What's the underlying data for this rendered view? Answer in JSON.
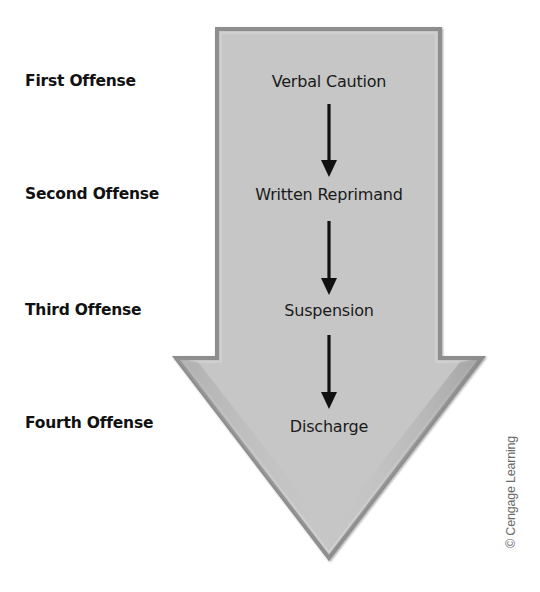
{
  "diagram": {
    "colors": {
      "arrow_fill": "#c6c6c6",
      "arrow_edge": "#8e8e8e",
      "step_arrow": "#111111",
      "text": "#1a1a1a",
      "credit_text": "#6a6a6a"
    },
    "stages": [
      {
        "offense": "First Offense",
        "action": "Verbal Caution"
      },
      {
        "offense": "Second Offense",
        "action": "Written Reprimand"
      },
      {
        "offense": "Third Offense",
        "action": "Suspension"
      },
      {
        "offense": "Fourth Offense",
        "action": "Discharge"
      }
    ],
    "step_arrows": [
      {
        "icon": "arrow-down-icon",
        "from": "Verbal Caution",
        "to": "Written Reprimand"
      },
      {
        "icon": "arrow-down-icon",
        "from": "Written Reprimand",
        "to": "Suspension"
      },
      {
        "icon": "arrow-down-icon",
        "from": "Suspension",
        "to": "Discharge"
      }
    ],
    "big_arrow_icon": "large-down-arrow-icon",
    "credit": "© Cengage Learning"
  }
}
